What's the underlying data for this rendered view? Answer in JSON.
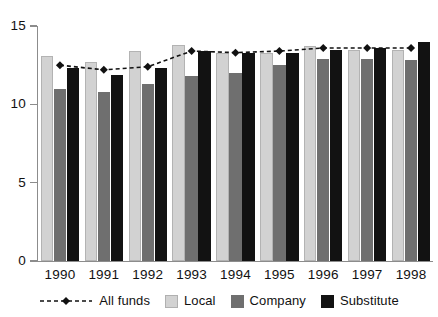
{
  "chart_data": {
    "type": "bar",
    "title": "",
    "subtitle": "",
    "xlabel": "",
    "ylabel": "",
    "categories": [
      "1990",
      "1991",
      "1992",
      "1993",
      "1994",
      "1995",
      "1996",
      "1997",
      "1998"
    ],
    "ylim": [
      0,
      15
    ],
    "yticks": [
      0,
      5,
      10,
      15
    ],
    "grid": false,
    "legend_position": "bottom",
    "series": [
      {
        "name": "All funds",
        "type": "line",
        "style": "dashed",
        "marker": "diamond",
        "color": "#111111",
        "values": [
          12.5,
          12.2,
          12.4,
          13.4,
          13.3,
          13.4,
          13.6,
          13.6,
          13.6
        ]
      },
      {
        "name": "Local",
        "type": "bar",
        "color": "#d2d2d2",
        "values": [
          13.1,
          12.7,
          13.4,
          13.8,
          13.3,
          13.3,
          13.7,
          13.5,
          13.5
        ]
      },
      {
        "name": "Company",
        "type": "bar",
        "color": "#6f6f6f",
        "values": [
          11.0,
          10.8,
          11.3,
          11.8,
          12.0,
          12.5,
          12.9,
          12.9,
          12.8
        ]
      },
      {
        "name": "Substitute",
        "type": "bar",
        "color": "#121212",
        "values": [
          12.3,
          11.9,
          12.3,
          13.4,
          13.3,
          13.3,
          13.5,
          13.6,
          14.0
        ]
      }
    ]
  },
  "axes": {
    "y_tick_labels": [
      "15",
      "10",
      "5",
      "0"
    ],
    "x_tick_labels": [
      "1990",
      "1991",
      "1992",
      "1993",
      "1994",
      "1995",
      "1996",
      "1997",
      "1998"
    ]
  },
  "legend": {
    "items": [
      {
        "label": "All funds",
        "marker": "dashed-line-diamond-icon",
        "color": "#111111"
      },
      {
        "label": "Local",
        "marker": "square-swatch-icon",
        "color": "#d2d2d2"
      },
      {
        "label": "Company",
        "marker": "square-swatch-icon",
        "color": "#6f6f6f"
      },
      {
        "label": "Substitute",
        "marker": "square-swatch-icon",
        "color": "#121212"
      }
    ]
  }
}
